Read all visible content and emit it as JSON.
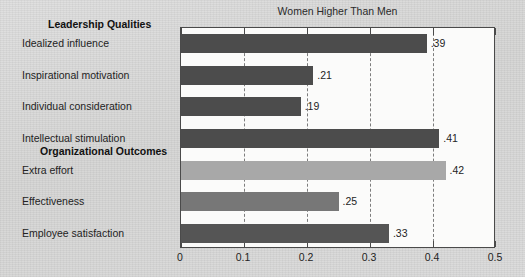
{
  "chart_data": {
    "type": "bar",
    "orientation": "horizontal",
    "title": "Women Higher Than Men",
    "xlabel": "",
    "ylabel": "",
    "xlim": [
      0,
      0.5
    ],
    "xticks": [
      "0",
      "0.1",
      "0.2",
      "0.3",
      "0.4",
      "0.5"
    ],
    "xtick_values": [
      0,
      0.1,
      0.2,
      0.3,
      0.4,
      0.5
    ],
    "grid": "vertical-dashed",
    "legend": "none",
    "groups": [
      {
        "name": "Leadership Qualities",
        "categories": [
          "Idealized influence",
          "Inspirational motivation",
          "Individual consideration",
          "Intellectual stimulation"
        ],
        "values": [
          0.39,
          0.21,
          0.19,
          0.41
        ],
        "labels": [
          ".39",
          ".21",
          ".19",
          ".41"
        ],
        "colors": [
          "#4c4c4c",
          "#4c4c4c",
          "#4c4c4c",
          "#4c4c4c"
        ]
      },
      {
        "name": "Organizational Outcomes",
        "categories": [
          "Extra effort",
          "Effectiveness",
          "Employee satisfaction"
        ],
        "values": [
          0.42,
          0.25,
          0.33
        ],
        "labels": [
          ".42",
          ".25",
          ".33"
        ],
        "colors": [
          "#a8a8a8",
          "#777777",
          "#555555"
        ]
      }
    ],
    "categories": [
      "Idealized influence",
      "Inspirational motivation",
      "Individual consideration",
      "Intellectual stimulation",
      "Extra effort",
      "Effectiveness",
      "Employee satisfaction"
    ],
    "values": [
      0.39,
      0.21,
      0.19,
      0.41,
      0.42,
      0.25,
      0.33
    ]
  },
  "bleed_text": {
    "line1": "Women Lead",
    "line2": "by doing better",
    "line3": "to",
    "line4": "they"
  }
}
